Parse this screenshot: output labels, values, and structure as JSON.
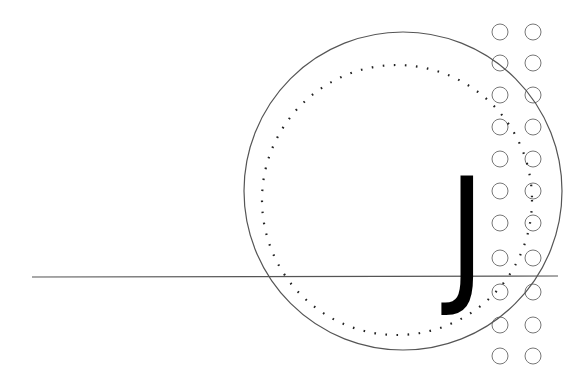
{
  "glyph": {
    "text": "J",
    "color": "#000000"
  },
  "colors": {
    "stroke": "#555555",
    "grid_stroke": "#777777",
    "dots": "#222222",
    "background": "#ffffff"
  },
  "shapes": {
    "outer_circle": {
      "cx": 403,
      "cy": 191,
      "r": 159
    },
    "dotted_circle": {
      "cx": 397,
      "cy": 200,
      "r": 135
    },
    "horizontal_line": {
      "x1": 32,
      "y1": 277,
      "x2": 558,
      "y2": 276
    },
    "grid": {
      "columns_x": [
        500,
        533
      ],
      "rows_y": [
        32,
        63,
        95,
        127,
        159,
        191,
        223,
        258,
        292,
        325,
        356
      ],
      "r": 8
    }
  }
}
